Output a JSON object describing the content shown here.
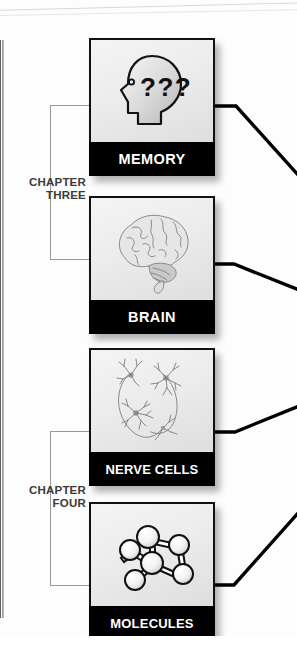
{
  "diagram": {
    "orientation": "vertical-column",
    "chapters": [
      {
        "id": "chapter-three",
        "line1": "CHAPTER",
        "line2": "THREE",
        "cards": [
          "memory",
          "brain"
        ]
      },
      {
        "id": "chapter-four",
        "line1": "CHAPTER",
        "line2": "FOUR",
        "cards": [
          "nerve-cells",
          "molecules"
        ]
      }
    ],
    "cards": [
      {
        "id": "memory",
        "label": "MEMORY",
        "icon": "head-with-question-marks-icon",
        "icon_text": "???",
        "x": 89,
        "y": 38
      },
      {
        "id": "brain",
        "label": "BRAIN",
        "icon": "brain-icon",
        "icon_text": "",
        "x": 89,
        "y": 196
      },
      {
        "id": "nerve-cells",
        "label": "NERVE CELLS",
        "icon": "neurons-icon",
        "icon_text": "",
        "x": 89,
        "y": 348
      },
      {
        "id": "molecules",
        "label": "MOLECULES",
        "icon": "molecule-ball-and-stick-icon",
        "icon_text": "",
        "x": 89,
        "y": 502
      }
    ],
    "colors": {
      "label_band": "#000000",
      "label_text": "#ffffff",
      "card_art_background": "#ececec",
      "bracket_line": "#9a9a9a",
      "connector_line": "#000000",
      "chapter_text": "#3b3b3b",
      "page_background": "#ffffff"
    }
  }
}
